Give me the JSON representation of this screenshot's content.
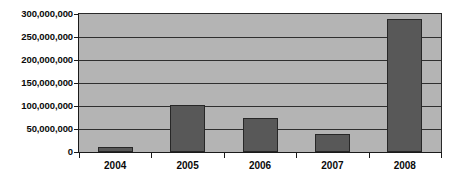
{
  "chart_data": {
    "type": "bar",
    "title": "",
    "subtitle": "",
    "xlabel": "",
    "ylabel": "",
    "categories": [
      "2004",
      "2005",
      "2006",
      "2007",
      "2008"
    ],
    "values": [
      10000000,
      103000000,
      73000000,
      40000000,
      290000000
    ],
    "series": [
      {
        "name": "",
        "values": [
          10000000,
          103000000,
          73000000,
          40000000,
          290000000
        ]
      }
    ],
    "ylim": [
      0,
      300000000
    ],
    "ytick_values": [
      0,
      50000000,
      100000000,
      150000000,
      200000000,
      250000000,
      300000000
    ],
    "ytick_labels": [
      "0",
      "50,000,000",
      "100,000,000",
      "150,000,000",
      "200,000,000",
      "250,000,000",
      "300,000,000"
    ],
    "grid": true,
    "grid_axis": "y",
    "legend": false,
    "legend_position": "none",
    "annotations": [],
    "colors": {
      "bar_fill": "#585858",
      "bar_outline": "#272727",
      "plot_background": "#b4b4b4",
      "gridline": "#2f2f2f",
      "axis_line": "#1a1a1a",
      "tick_label": "#0a0a0a",
      "figure_background": "#ffffff"
    }
  }
}
